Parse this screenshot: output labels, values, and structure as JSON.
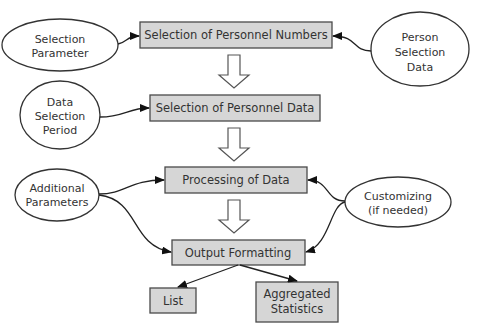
{
  "diagram": {
    "type": "flowchart",
    "process_boxes": [
      {
        "id": "selection-personnel-numbers",
        "label": "Selection of Personnel Numbers"
      },
      {
        "id": "selection-personnel-data",
        "label": "Selection of Personnel Data"
      },
      {
        "id": "processing-of-data",
        "label": "Processing of Data"
      },
      {
        "id": "output-formatting",
        "label": "Output Formatting"
      },
      {
        "id": "list",
        "label": "List"
      },
      {
        "id": "aggregated-statistics",
        "lines": [
          "Aggregated",
          "Statistics"
        ]
      }
    ],
    "inputs": [
      {
        "id": "selection-parameter",
        "lines": [
          "Selection",
          "Parameter"
        ]
      },
      {
        "id": "person-selection-data",
        "lines": [
          "Person",
          "Selection",
          "Data"
        ]
      },
      {
        "id": "data-selection-period",
        "lines": [
          "Data",
          "Selection",
          "Period"
        ]
      },
      {
        "id": "additional-parameters",
        "lines": [
          "Additional",
          "Parameters"
        ]
      },
      {
        "id": "customizing",
        "lines": [
          "Customizing",
          "(if needed)"
        ]
      }
    ],
    "edges": [
      {
        "from": "Selection Parameter",
        "to": "Selection of Personnel Numbers"
      },
      {
        "from": "Person Selection Data",
        "to": "Selection of Personnel Numbers"
      },
      {
        "from": "Selection of Personnel Numbers",
        "to": "Selection of Personnel Data",
        "style": "hollow-arrow"
      },
      {
        "from": "Data Selection Period",
        "to": "Selection of Personnel Data"
      },
      {
        "from": "Selection of Personnel Data",
        "to": "Processing of Data",
        "style": "hollow-arrow"
      },
      {
        "from": "Additional Parameters",
        "to": "Processing of Data"
      },
      {
        "from": "Additional Parameters",
        "to": "Output Formatting"
      },
      {
        "from": "Customizing (if needed)",
        "to": "Processing of Data"
      },
      {
        "from": "Customizing (if needed)",
        "to": "Output Formatting"
      },
      {
        "from": "Processing of Data",
        "to": "Output Formatting",
        "style": "hollow-arrow"
      },
      {
        "from": "Output Formatting",
        "to": "List"
      },
      {
        "from": "Output Formatting",
        "to": "Aggregated Statistics"
      }
    ],
    "colors": {
      "box_fill": "#d6d6d6",
      "box_stroke": "#4a4a4a",
      "ellipse_fill": "#ffffff",
      "line": "#222222"
    }
  }
}
